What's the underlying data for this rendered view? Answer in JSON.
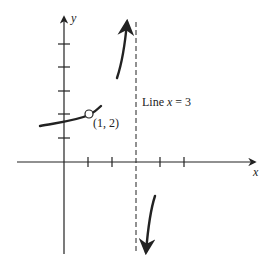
{
  "diagram": {
    "type": "function-graph",
    "axes": {
      "x_label": "x",
      "y_label": "y",
      "origin_px": [
        64,
        162
      ],
      "unit_px": 24,
      "x_ticks": [
        1,
        2,
        3,
        4,
        5
      ],
      "y_ticks": [
        1,
        2,
        3,
        4,
        5
      ]
    },
    "point": {
      "label": "(1, 2)",
      "type": "open-circle",
      "x": 1,
      "y": 2
    },
    "asymptote": {
      "label_prefix": "Line ",
      "label_var": "x",
      "label_eq": " = ",
      "label_val": "3",
      "x": 3,
      "style": "dashed"
    },
    "branches": [
      {
        "name": "left-branch",
        "description": "increasing curve ending at open circle (1,2) and continuing slightly"
      },
      {
        "name": "upper-branch",
        "description": "rises to +infinity approaching x=3 from the left"
      },
      {
        "name": "lower-branch",
        "description": "falls to -infinity approaching x=3 from the right"
      }
    ],
    "colors": {
      "stroke": "#222222",
      "background": "#ffffff"
    }
  }
}
